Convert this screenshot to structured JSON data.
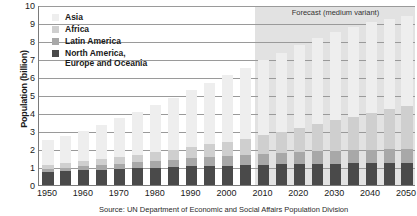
{
  "chart_data": {
    "type": "bar",
    "title": "",
    "subtitle": "",
    "xlabel": "",
    "ylabel": "Population (billion)",
    "ylim": [
      0,
      10
    ],
    "yticks": [
      0,
      1,
      2,
      3,
      4,
      5,
      6,
      7,
      8,
      9,
      10
    ],
    "grid": true,
    "stacked": true,
    "legend_position": "top-left",
    "annotations": [
      {
        "text": "Forecast (medium variant)",
        "from_x": 2010,
        "to_x": 2050
      }
    ],
    "source": "Source: UN Department of Economic and Social Affairs Population Division",
    "categories": [
      "1950",
      "1955",
      "1960",
      "1965",
      "1970",
      "1975",
      "1980",
      "1985",
      "1990",
      "1995",
      "2000",
      "2005",
      "2010",
      "2015",
      "2020",
      "2025",
      "2030",
      "2035",
      "2040",
      "2045",
      "2050"
    ],
    "xtick_labels": [
      "1950",
      "1960",
      "1970",
      "1980",
      "1990",
      "2000",
      "2010",
      "2020",
      "2030",
      "2040",
      "2050"
    ],
    "series": [
      {
        "name": "North America, Europe and Oceania",
        "color": "#4a4a4a",
        "values": [
          0.73,
          0.77,
          0.81,
          0.86,
          0.9,
          0.94,
          0.97,
          1.0,
          1.04,
          1.06,
          1.08,
          1.1,
          1.12,
          1.14,
          1.16,
          1.18,
          1.19,
          1.2,
          1.21,
          1.21,
          1.21
        ]
      },
      {
        "name": "Latin America",
        "color": "#a8a8a8",
        "values": [
          0.17,
          0.19,
          0.22,
          0.25,
          0.29,
          0.32,
          0.36,
          0.4,
          0.44,
          0.48,
          0.52,
          0.56,
          0.6,
          0.63,
          0.66,
          0.69,
          0.72,
          0.74,
          0.76,
          0.77,
          0.78
        ]
      },
      {
        "name": "Africa",
        "color": "#cfcfcf",
        "values": [
          0.23,
          0.25,
          0.29,
          0.32,
          0.37,
          0.42,
          0.48,
          0.55,
          0.63,
          0.72,
          0.81,
          0.92,
          1.04,
          1.19,
          1.34,
          1.51,
          1.68,
          1.86,
          2.04,
          2.23,
          2.41
        ]
      },
      {
        "name": "Asia",
        "color": "#eeeeee",
        "values": [
          1.4,
          1.54,
          1.7,
          1.9,
          2.14,
          2.39,
          2.63,
          2.89,
          3.18,
          3.43,
          3.68,
          3.93,
          4.16,
          4.39,
          4.6,
          4.77,
          4.9,
          4.98,
          5.02,
          5.02,
          4.98
        ]
      }
    ],
    "totals": [
      2.53,
      2.75,
      3.02,
      3.33,
      3.7,
      4.07,
      4.44,
      4.84,
      5.29,
      5.69,
      6.09,
      6.51,
      6.92,
      7.35,
      7.76,
      8.15,
      8.49,
      8.78,
      9.03,
      9.23,
      9.38
    ]
  },
  "legend": {
    "items": [
      {
        "label": "Asia",
        "color": "#eeeeee"
      },
      {
        "label": "Africa",
        "color": "#cfcfcf"
      },
      {
        "label": "Latin America",
        "color": "#a8a8a8"
      },
      {
        "label": "North America,\nEurope and Oceania",
        "color": "#4a4a4a"
      }
    ]
  },
  "forecast": {
    "label": "Forecast (medium variant)",
    "band_color": "#e2e2e2"
  },
  "axis": {
    "y_title": "Population (billion)"
  },
  "source": {
    "text": "Source: UN Department of Economic and Social Affairs Population Division"
  }
}
